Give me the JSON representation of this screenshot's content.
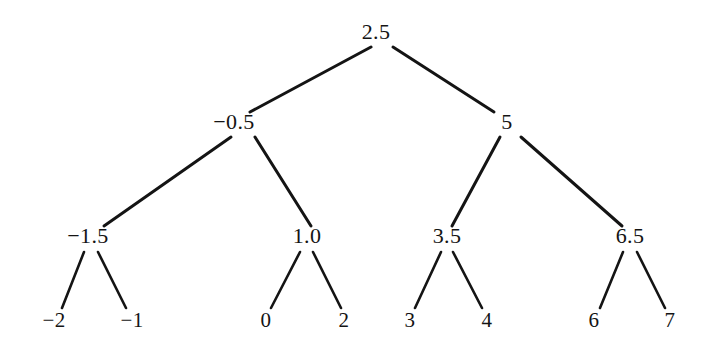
{
  "figure": {
    "background_color": "#ffffff",
    "stroke_color": "#141414",
    "text_color": "#141414"
  },
  "chart_data": {
    "type": "diagram",
    "subtype": "binary-tree",
    "title": "",
    "xlabel": "",
    "ylabel": "",
    "grid": false,
    "legend": null,
    "levels": 4,
    "nodes": [
      {
        "id": "n0",
        "label": "2.5",
        "value": 2.5,
        "level": 0,
        "x": 376,
        "y": 32,
        "parent": null
      },
      {
        "id": "n1",
        "label": "−0.5",
        "value": -0.5,
        "level": 1,
        "x": 234,
        "y": 122,
        "parent": "n0"
      },
      {
        "id": "n2",
        "label": "5",
        "value": 5,
        "level": 1,
        "x": 507,
        "y": 122,
        "parent": "n0"
      },
      {
        "id": "n3",
        "label": "−1.5",
        "value": -1.5,
        "level": 2,
        "x": 88,
        "y": 236,
        "parent": "n1"
      },
      {
        "id": "n4",
        "label": "1.0",
        "value": 1.0,
        "level": 2,
        "x": 307,
        "y": 236,
        "parent": "n1"
      },
      {
        "id": "n5",
        "label": "3.5",
        "value": 3.5,
        "level": 2,
        "x": 447,
        "y": 236,
        "parent": "n2"
      },
      {
        "id": "n6",
        "label": "6.5",
        "value": 6.5,
        "level": 2,
        "x": 630,
        "y": 236,
        "parent": "n2"
      },
      {
        "id": "n7",
        "label": "−2",
        "value": -2,
        "level": 3,
        "x": 54,
        "y": 320,
        "parent": "n3"
      },
      {
        "id": "n8",
        "label": "−1",
        "value": -1,
        "level": 3,
        "x": 132,
        "y": 320,
        "parent": "n3"
      },
      {
        "id": "n9",
        "label": "0",
        "value": 0,
        "level": 3,
        "x": 266,
        "y": 320,
        "parent": "n4"
      },
      {
        "id": "n10",
        "label": "2",
        "value": 2,
        "level": 3,
        "x": 344,
        "y": 320,
        "parent": "n4"
      },
      {
        "id": "n11",
        "label": "3",
        "value": 3,
        "level": 3,
        "x": 410,
        "y": 320,
        "parent": "n5"
      },
      {
        "id": "n12",
        "label": "4",
        "value": 4,
        "level": 3,
        "x": 487,
        "y": 320,
        "parent": "n5"
      },
      {
        "id": "n13",
        "label": "6",
        "value": 6,
        "level": 3,
        "x": 594,
        "y": 320,
        "parent": "n6"
      },
      {
        "id": "n14",
        "label": "7",
        "value": 7,
        "level": 3,
        "x": 670,
        "y": 320,
        "parent": "n6"
      }
    ],
    "edges": [
      {
        "from": "n0",
        "to": "n1",
        "x1": 371,
        "y1": 47,
        "x2": 250,
        "y2": 112,
        "width": 3.0
      },
      {
        "from": "n0",
        "to": "n2",
        "x1": 393,
        "y1": 47,
        "x2": 494,
        "y2": 112,
        "width": 3.0
      },
      {
        "from": "n1",
        "to": "n3",
        "x1": 231,
        "y1": 137,
        "x2": 104,
        "y2": 226,
        "width": 3.0
      },
      {
        "from": "n1",
        "to": "n4",
        "x1": 255,
        "y1": 137,
        "x2": 311,
        "y2": 226,
        "width": 3.0
      },
      {
        "from": "n2",
        "to": "n5",
        "x1": 500,
        "y1": 137,
        "x2": 452,
        "y2": 226,
        "width": 3.0
      },
      {
        "from": "n2",
        "to": "n6",
        "x1": 521,
        "y1": 137,
        "x2": 622,
        "y2": 226,
        "width": 3.0
      },
      {
        "from": "n3",
        "to": "n7",
        "x1": 84,
        "y1": 252,
        "x2": 62,
        "y2": 308,
        "width": 2.6
      },
      {
        "from": "n3",
        "to": "n8",
        "x1": 98,
        "y1": 252,
        "x2": 126,
        "y2": 308,
        "width": 2.6
      },
      {
        "from": "n4",
        "to": "n9",
        "x1": 300,
        "y1": 252,
        "x2": 271,
        "y2": 308,
        "width": 2.6
      },
      {
        "from": "n4",
        "to": "n10",
        "x1": 313,
        "y1": 252,
        "x2": 341,
        "y2": 308,
        "width": 2.6
      },
      {
        "from": "n5",
        "to": "n11",
        "x1": 441,
        "y1": 252,
        "x2": 415,
        "y2": 308,
        "width": 2.6
      },
      {
        "from": "n5",
        "to": "n12",
        "x1": 453,
        "y1": 252,
        "x2": 482,
        "y2": 308,
        "width": 2.6
      },
      {
        "from": "n6",
        "to": "n13",
        "x1": 623,
        "y1": 252,
        "x2": 600,
        "y2": 308,
        "width": 2.6
      },
      {
        "from": "n6",
        "to": "n14",
        "x1": 637,
        "y1": 252,
        "x2": 665,
        "y2": 308,
        "width": 2.6
      }
    ]
  }
}
